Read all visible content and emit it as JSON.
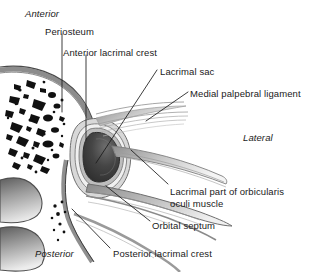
{
  "figure": {
    "style": "grayscale anatomical line drawing",
    "background": "#ffffff",
    "ink": "#1a1a1a"
  },
  "orientation_labels": [
    {
      "id": "anterior",
      "text": "Anterior",
      "style": "italic",
      "x": 25,
      "y": 8
    },
    {
      "id": "lateral",
      "text": "Lateral",
      "style": "italic",
      "x": 243,
      "y": 132
    },
    {
      "id": "posterior",
      "text": "Posterior",
      "style": "italic",
      "x": 35,
      "y": 248
    }
  ],
  "structure_labels": [
    {
      "id": "periosteum",
      "text": "Periosteum",
      "x": 45,
      "y": 26
    },
    {
      "id": "anterior-lacrimal-crest",
      "text": "Anterior lacrimal crest",
      "x": 63,
      "y": 47
    },
    {
      "id": "lacrimal-sac",
      "text": "Lacrimal sac",
      "x": 160,
      "y": 66
    },
    {
      "id": "medial-palpebral-ligament",
      "text": "Medial palpebral ligament",
      "x": 190,
      "y": 88
    },
    {
      "id": "lacrimal-part-orbicularis",
      "text": "Lacrimal part of orbicularis\noculi muscle",
      "x": 170,
      "y": 186,
      "line1": "Lacrimal part of orbicularis",
      "line2": "oculi muscle"
    },
    {
      "id": "orbital-septum",
      "text": "Orbital septum",
      "x": 152,
      "y": 220
    },
    {
      "id": "posterior-lacrimal-crest",
      "text": "Posterior lacrimal crest",
      "x": 113,
      "y": 248
    }
  ],
  "anatomy_parts": [
    {
      "id": "trabecular-bone",
      "name": "Trabecular (cancellous) bone with marrow spaces",
      "fill": "#ffffff",
      "speckles": "#111111"
    },
    {
      "id": "periosteum-band",
      "name": "Periosteum layer lining the orbital bone",
      "fill": "#b9b9b9"
    },
    {
      "id": "lacrimal-sac-lumen",
      "name": "Lacrimal sac lumen",
      "fill": "#3a3a3a"
    },
    {
      "id": "lacrimal-sac-wall",
      "name": "Lacrimal sac wall (concentric layers)",
      "fill": "#9a9a9a"
    },
    {
      "id": "nasal-turbinate-upper",
      "name": "Upper bone mass / turbinate",
      "fill": "#8d8d8d"
    },
    {
      "id": "nasal-turbinate-lower",
      "name": "Lower bone mass / turbinate",
      "fill": "#8d8d8d"
    },
    {
      "id": "orbicularis-bands",
      "name": "Striated muscle fiber bands",
      "fill": "#c4c4c4"
    },
    {
      "id": "orbital-septum-sheet",
      "name": "Orbital septum fibrous sheet",
      "fill": "#bdbdbd"
    }
  ],
  "leader_lines": [
    {
      "id": "leader-periosteum",
      "from": [
        62,
        34
      ],
      "to": [
        62,
        112
      ]
    },
    {
      "id": "leader-anterior-lacrimal-crest",
      "from": [
        86,
        55
      ],
      "to": [
        86,
        140
      ]
    },
    {
      "id": "leader-lacrimal-sac",
      "from": [
        157,
        70
      ],
      "to": [
        96,
        163
      ]
    },
    {
      "id": "leader-medial-palpebral-ligament",
      "from": [
        188,
        92
      ],
      "to": [
        146,
        121
      ]
    },
    {
      "id": "leader-lacrimal-part-orbicularis",
      "from": [
        168,
        186
      ],
      "to": [
        131,
        150
      ]
    },
    {
      "id": "leader-orbital-septum",
      "from": [
        150,
        222
      ],
      "to": [
        106,
        186
      ]
    },
    {
      "id": "leader-posterior-lacrimal-crest",
      "from": [
        110,
        249
      ],
      "to": [
        72,
        209
      ]
    }
  ]
}
